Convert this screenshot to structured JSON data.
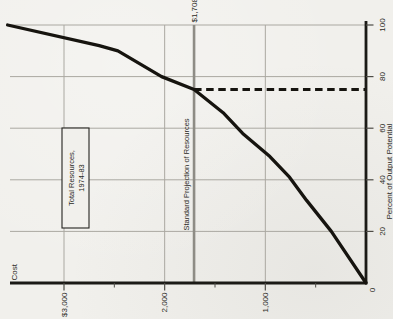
{
  "figure": {
    "background": "#f1f0ec"
  },
  "chart_data": {
    "type": "line",
    "rotated": "90deg-counterclockwise",
    "xlabel": "Percent of Output Potential",
    "ylabel": "Cost",
    "xlim": [
      0,
      100
    ],
    "ylim": [
      0,
      3580
    ],
    "grid": true,
    "x_ticks": [
      {
        "value": 20,
        "label": "20"
      },
      {
        "value": 40,
        "label": "40"
      },
      {
        "value": 60,
        "label": "60"
      },
      {
        "value": 80,
        "label": "80"
      },
      {
        "value": 100,
        "label": "100"
      }
    ],
    "y_ticks": [
      {
        "value": 1000,
        "label": "1,000"
      },
      {
        "value": 2000,
        "label": "2,000"
      },
      {
        "value": 3000,
        "label": "$3,000"
      }
    ],
    "y_minor_ticks": [
      500,
      1500,
      2500
    ],
    "origin_label": "0",
    "series": [
      {
        "name": "Total Resources, 1974-83",
        "style": "solid",
        "points": [
          [
            0,
            0
          ],
          [
            20,
            345
          ],
          [
            32,
            590
          ],
          [
            41,
            760
          ],
          [
            49,
            955
          ],
          [
            58,
            1225
          ],
          [
            66,
            1420
          ],
          [
            75,
            1708
          ],
          [
            80,
            2030
          ],
          [
            90,
            2465
          ],
          [
            92,
            2650
          ],
          [
            100,
            3560
          ]
        ]
      }
    ],
    "annotations": {
      "reference_line": {
        "cost": 1708,
        "value_label": "$1,708",
        "caption": "Standard Projection of Resources"
      },
      "dashed_drop_line": {
        "at_percent": 75,
        "from_cost": 1708,
        "to_cost": 0
      },
      "label_box": {
        "lines": [
          "Total Resources,",
          "1974-83"
        ]
      }
    },
    "colors": {
      "curve": "#16140f",
      "axis": "#1b1a16",
      "grid": "#aaa8a1",
      "tick": "#4e4c46",
      "reference_line": "#8e8c85",
      "text": "#2b2a25",
      "background": "#f1f0ec",
      "box_border": "#24231f"
    }
  }
}
